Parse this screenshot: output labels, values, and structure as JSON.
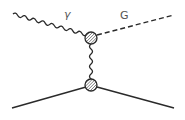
{
  "diagram": {
    "type": "feynman",
    "labels": {
      "photon": "γ",
      "graviton": "G"
    },
    "colors": {
      "line": "#2a2a2a",
      "label": "#555555",
      "vertex_fill": "#cfcfcf"
    },
    "particles": [
      {
        "name": "photon",
        "style": "wavy",
        "from": "incoming-left",
        "to": "top-vertex"
      },
      {
        "name": "graviton",
        "style": "dashed",
        "from": "top-vertex",
        "to": "outgoing-right"
      },
      {
        "name": "exchange",
        "style": "wavy",
        "from": "top-vertex",
        "to": "bottom-vertex"
      },
      {
        "name": "fermion-in",
        "style": "solid",
        "from": "incoming-left",
        "to": "bottom-vertex"
      },
      {
        "name": "fermion-out",
        "style": "solid",
        "from": "bottom-vertex",
        "to": "outgoing-right"
      }
    ],
    "vertices": [
      {
        "name": "top-vertex",
        "style": "hatched-blob"
      },
      {
        "name": "bottom-vertex",
        "style": "hatched-blob"
      }
    ]
  }
}
